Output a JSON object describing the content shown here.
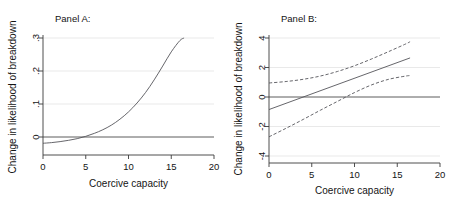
{
  "figure": {
    "background": "#ffffff",
    "grid_color": "#e6e6e6",
    "line_color": "#55555a",
    "axis_color": "#3b3b3b"
  },
  "chart_data": [
    {
      "type": "line",
      "panel_label": "Panel A:",
      "title": "Panel A:",
      "xlabel": "Coercive capacity",
      "ylabel": "Change in likelihood of breakdown",
      "xlim": [
        0,
        20
      ],
      "ylim": [
        -0.035,
        0.32
      ],
      "xticks": [
        0,
        5,
        10,
        15,
        20
      ],
      "xticklabels": [
        "0",
        "5",
        "10",
        "15",
        "20"
      ],
      "yticks": [
        0,
        0.1,
        0.2,
        0.3
      ],
      "yticklabels": [
        "0",
        ".1",
        ".2",
        ".3"
      ],
      "grid": "horizontal",
      "legend": "none",
      "zero_reference_line": 0,
      "series": [
        {
          "name": "Predicted change",
          "style": "solid",
          "x": [
            0,
            1,
            2,
            3,
            4,
            5,
            6,
            7,
            8,
            9,
            10,
            11,
            12,
            13,
            14,
            15,
            16,
            16.5
          ],
          "values": [
            -0.019,
            -0.017,
            -0.014,
            -0.01,
            -0.005,
            0.002,
            0.011,
            0.022,
            0.036,
            0.054,
            0.076,
            0.103,
            0.135,
            0.173,
            0.215,
            0.258,
            0.292,
            0.3
          ]
        }
      ]
    },
    {
      "type": "line",
      "panel_label": "Panel B:",
      "title": "Panel B:",
      "xlabel": "Coercive capacity",
      "ylabel": "Change in likelihood of breakdown",
      "xlim": [
        0,
        20
      ],
      "ylim": [
        -4.6,
        4.4
      ],
      "xticks": [
        0,
        5,
        10,
        15,
        20
      ],
      "xticklabels": [
        "0",
        "5",
        "10",
        "15",
        "20"
      ],
      "yticks": [
        -4,
        -2,
        0,
        2,
        4
      ],
      "yticklabels": [
        "-4",
        "-2",
        "0",
        "2",
        "4"
      ],
      "grid": "horizontal",
      "legend": "none",
      "zero_reference_line": 0,
      "series": [
        {
          "name": "Predicted change",
          "style": "solid",
          "x": [
            0,
            16.5
          ],
          "values": [
            -0.85,
            2.65
          ]
        },
        {
          "name": "Upper 95% confidence bound",
          "style": "dashed",
          "x": [
            0,
            2,
            4,
            6,
            8,
            10,
            12,
            14,
            16,
            16.5
          ],
          "values": [
            0.95,
            1.05,
            1.2,
            1.42,
            1.73,
            2.12,
            2.58,
            3.08,
            3.6,
            3.75
          ]
        },
        {
          "name": "Lower 95% confidence bound",
          "style": "dashed",
          "x": [
            0,
            2,
            4,
            6,
            8,
            10,
            12,
            14,
            16,
            16.5
          ],
          "values": [
            -2.7,
            -2.12,
            -1.52,
            -0.9,
            -0.3,
            0.3,
            0.82,
            1.2,
            1.42,
            1.45
          ]
        }
      ]
    }
  ]
}
